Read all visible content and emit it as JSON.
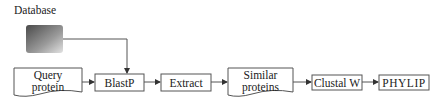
{
  "diagram": {
    "database_label": "Database",
    "nodes": [
      {
        "id": "query",
        "label_line1": "Query",
        "label_line2": "protein",
        "shape": "document"
      },
      {
        "id": "blastp",
        "label": "BlastP",
        "shape": "box"
      },
      {
        "id": "extract",
        "label": "Extract",
        "shape": "box"
      },
      {
        "id": "similar",
        "label_line1": "Similar",
        "label_line2": "proteins",
        "shape": "document"
      },
      {
        "id": "clustalw",
        "label": "Clustal W",
        "shape": "box"
      },
      {
        "id": "phylip",
        "label": "PHYLIP",
        "shape": "box"
      }
    ],
    "edges": [
      {
        "from": "database",
        "to": "blastp"
      },
      {
        "from": "query",
        "to": "blastp"
      },
      {
        "from": "blastp",
        "to": "extract"
      },
      {
        "from": "extract",
        "to": "similar"
      },
      {
        "from": "similar",
        "to": "clustalw"
      },
      {
        "from": "clustalw",
        "to": "phylip"
      }
    ],
    "colors": {
      "stroke": "#555555",
      "db_dark": "#555555",
      "db_light": "#d8d8d8"
    }
  }
}
